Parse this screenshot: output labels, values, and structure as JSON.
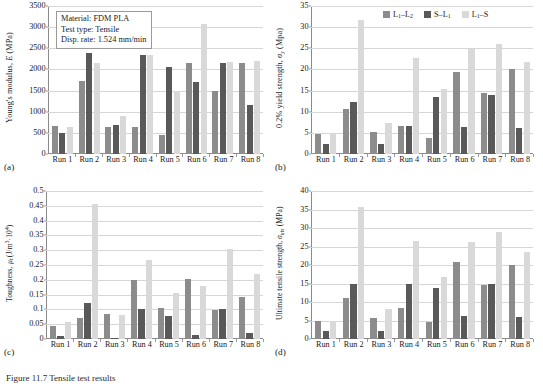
{
  "figure": {
    "caption": "Figure 11.7 Tensile test results",
    "colors": {
      "series1": "#8c8c8c",
      "series2": "#595959",
      "series3": "#d9d9d9",
      "grid": "#d6d6d6",
      "axis": "#8a8a8a",
      "text": "#1a1a1a"
    }
  },
  "legend": {
    "position": "top-center-panel-b",
    "items": [
      {
        "label": "L₁–L₂",
        "color": "#8c8c8c",
        "name": "L1-L2"
      },
      {
        "label": "S–L₁",
        "color": "#595959",
        "name": "S-L1"
      },
      {
        "label": "L₁–S",
        "color": "#d9d9d9",
        "name": "L1-S"
      }
    ]
  },
  "infobox": {
    "lines": [
      "Material: FDM PLA",
      "Test type: Tensile",
      "Disp. rate: 1.524 mm/min"
    ]
  },
  "panels": [
    {
      "letter": "(a)",
      "name": "youngs-modulus"
    },
    {
      "letter": "(b)",
      "name": "yield-strength"
    },
    {
      "letter": "(c)",
      "name": "toughness"
    },
    {
      "letter": "(d)",
      "name": "ultimate-tensile-strength"
    }
  ],
  "chart_data": [
    {
      "type": "bar",
      "panel": "(a)",
      "title": "",
      "ylabel": "Young's modulus, E (MPa)",
      "xlabel": "",
      "categories": [
        "Run 1",
        "Run 2",
        "Run 3",
        "Run 4",
        "Run 5",
        "Run 6",
        "Run 7",
        "Run 8"
      ],
      "series": [
        {
          "name": "L₁–L₂",
          "color": "#8c8c8c",
          "values": [
            660,
            1715,
            650,
            640,
            450,
            2145,
            1485,
            2145
          ]
        },
        {
          "name": "S–L₁",
          "color": "#595959",
          "values": [
            495,
            2390,
            680,
            2330,
            2050,
            1700,
            2160,
            1155
          ]
        },
        {
          "name": "L₁–S",
          "color": "#d9d9d9",
          "values": [
            630,
            2150,
            895,
            2345,
            1495,
            3075,
            2175,
            2195
          ]
        }
      ],
      "ylim": [
        0,
        3500
      ],
      "yticks": [
        0,
        500,
        1000,
        1500,
        2000,
        2500,
        3000,
        3500
      ],
      "grid": true,
      "legend": false
    },
    {
      "type": "bar",
      "panel": "(b)",
      "title": "",
      "ylabel": "0.2% yield strength, σᵧ (Mpa)",
      "xlabel": "",
      "categories": [
        "Run 1",
        "Run 2",
        "Run 3",
        "Run 4",
        "Run 5",
        "Run 6",
        "Run 7",
        "Run 8"
      ],
      "series": [
        {
          "name": "L₁–L₂",
          "color": "#8c8c8c",
          "values": [
            4.8,
            10.7,
            5.3,
            6.7,
            3.7,
            19.5,
            14.5,
            20.0
          ]
        },
        {
          "name": "S–L₁",
          "color": "#595959",
          "values": [
            2.3,
            12.4,
            2.3,
            6.7,
            13.4,
            6.5,
            13.9,
            6.2
          ]
        },
        {
          "name": "L₁–S",
          "color": "#d9d9d9",
          "values": [
            4.8,
            31.7,
            7.3,
            22.7,
            15.3,
            24.9,
            25.9,
            21.7
          ]
        }
      ],
      "ylim": [
        0,
        35
      ],
      "yticks": [
        0,
        5,
        10,
        15,
        20,
        25,
        30,
        35
      ],
      "grid": true,
      "legend": true
    },
    {
      "type": "bar",
      "panel": "(c)",
      "title": "",
      "ylabel": "Toughness, μₜ (J/m³·10⁴)",
      "xlabel": "",
      "categories": [
        "Run 1",
        "Run 2",
        "Run 3",
        "Run 4",
        "Run 5",
        "Run 6",
        "Run 7",
        "Run 8"
      ],
      "series": [
        {
          "name": "L₁–L₂",
          "color": "#8c8c8c",
          "values": [
            0.043,
            0.07,
            0.084,
            0.201,
            0.104,
            0.204,
            0.097,
            0.143
          ]
        },
        {
          "name": "S–L₁",
          "color": "#595959",
          "values": [
            0.009,
            0.12,
            0.004,
            0.103,
            0.078,
            0.015,
            0.102,
            0.02
          ]
        },
        {
          "name": "L₁–S",
          "color": "#d9d9d9",
          "values": [
            0.058,
            0.455,
            0.08,
            0.266,
            0.156,
            0.18,
            0.305,
            0.221
          ]
        }
      ],
      "ylim": [
        0,
        0.5
      ],
      "yticks": [
        0,
        0.05,
        0.1,
        0.15,
        0.2,
        0.25,
        0.3,
        0.35,
        0.4,
        0.45,
        0.5
      ],
      "grid": true,
      "legend": false
    },
    {
      "type": "bar",
      "panel": "(d)",
      "title": "",
      "ylabel": "Ultimate tensile strength, σᵤₜₛ (MPa)",
      "xlabel": "",
      "categories": [
        "Run 1",
        "Run 2",
        "Run 3",
        "Run 4",
        "Run 5",
        "Run 6",
        "Run 7",
        "Run 8"
      ],
      "series": [
        {
          "name": "L₁–L₂",
          "color": "#8c8c8c",
          "values": [
            5.0,
            11.1,
            5.7,
            8.3,
            4.5,
            20.9,
            14.7,
            20.0
          ]
        },
        {
          "name": "S–L₁",
          "color": "#595959",
          "values": [
            2.2,
            14.9,
            2.3,
            14.8,
            13.8,
            6.1,
            15.0,
            5.9
          ]
        },
        {
          "name": "L₁–S",
          "color": "#d9d9d9",
          "values": [
            5.0,
            35.8,
            8.0,
            26.6,
            16.7,
            26.2,
            29.0,
            23.4
          ]
        }
      ],
      "ylim": [
        0,
        40
      ],
      "yticks": [
        0,
        5,
        10,
        15,
        20,
        25,
        30,
        35,
        40
      ],
      "grid": true,
      "legend": false
    }
  ]
}
